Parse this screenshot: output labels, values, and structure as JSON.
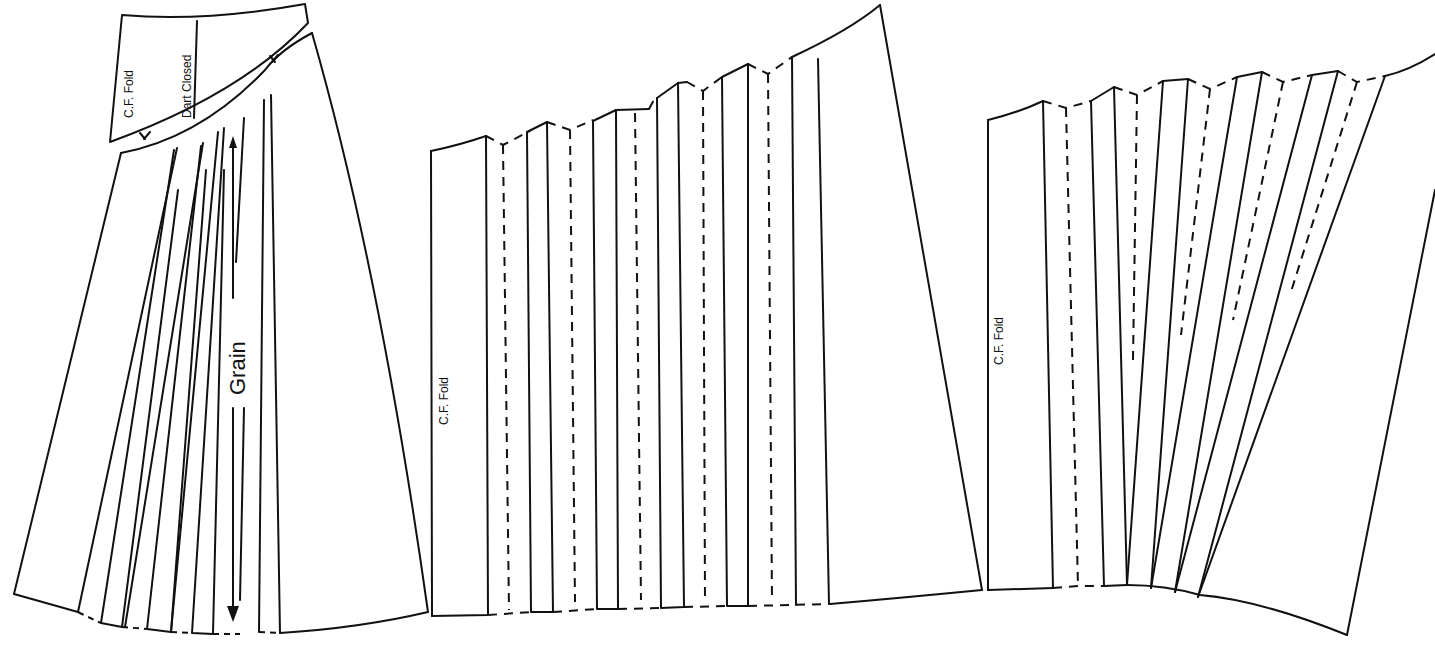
{
  "figure": {
    "pieces": [
      {
        "id": "piece-1",
        "description": "Yoke and flared skirt panel with slash lines spread",
        "labels": {
          "cf_fold": "C.F. Fold",
          "dart_closed": "Dart Closed",
          "grain": "Grain"
        }
      },
      {
        "id": "piece-2",
        "description": "Skirt panel slashed and spread parallel for pleats",
        "labels": {
          "cf_fold": "C.F. Fold"
        }
      },
      {
        "id": "piece-3",
        "description": "Skirt panel slashed and spread fanned for pleats",
        "labels": {
          "cf_fold": "C.F. Fold"
        }
      }
    ],
    "colors": {
      "line": "#111111",
      "background": "#ffffff"
    }
  }
}
